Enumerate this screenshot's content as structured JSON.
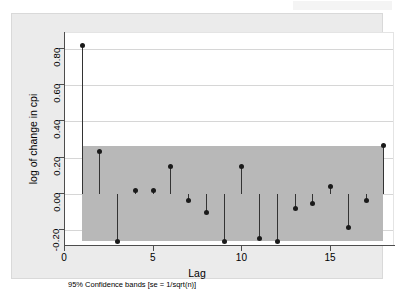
{
  "watermark": {
    "text": ""
  },
  "chart_data": {
    "type": "bar",
    "title": "",
    "subtitle": "",
    "xlabel": "Lag",
    "ylabel": "log of change in cpi",
    "note": "95% Confidence bands [se = 1/sqrt(n)]",
    "xlim": [
      0,
      18.6
    ],
    "ylim": [
      -0.29,
      0.89
    ],
    "grid": true,
    "legend": "none",
    "xticks": [
      0,
      5,
      10,
      15
    ],
    "xtick_labels": [
      "0",
      "5",
      "10",
      "15"
    ],
    "yticks": [
      -0.2,
      0.0,
      0.2,
      0.4,
      0.6,
      0.8
    ],
    "ytick_labels": [
      "-0.20",
      "0.00",
      "0.20",
      "0.40",
      "0.60",
      "0.80"
    ],
    "confidence_band": {
      "label": "95% Confidence bands",
      "se_formula": "se = 1/sqrt(n)",
      "upper": 0.265,
      "lower": -0.265,
      "x_start": 1,
      "x_end": 18,
      "color": "#b8b8b8"
    },
    "categories": [
      1,
      2,
      3,
      4,
      5,
      6,
      7,
      8,
      9,
      10,
      11,
      12,
      13,
      14,
      15,
      16,
      17,
      18
    ],
    "values": [
      0.82,
      0.235,
      -0.265,
      0.015,
      0.02,
      0.15,
      -0.04,
      -0.105,
      -0.265,
      0.15,
      -0.25,
      -0.265,
      -0.085,
      -0.055,
      0.04,
      -0.185,
      -0.04,
      0.265
    ],
    "marker_color": "#1a1a1a",
    "stem_color": "#333333"
  }
}
